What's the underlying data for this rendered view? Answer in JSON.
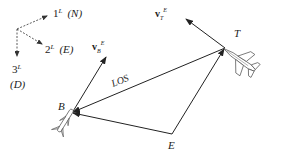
{
  "diagram": {
    "type": "engagement-geometry",
    "colors": {
      "stroke": "#222222",
      "aircraft": "#555555",
      "background": "#ffffff"
    },
    "frame": {
      "axis1": {
        "label": "1",
        "sup": "L",
        "dir": "(N)"
      },
      "axis2": {
        "label": "2",
        "sup": "L",
        "dir": "(E)"
      },
      "axis3": {
        "label": "3",
        "sup": "L",
        "dir": "(D)"
      }
    },
    "points": {
      "B": "B",
      "T": "T",
      "E": "E"
    },
    "los_label": "LOS",
    "vectors": {
      "vB": {
        "base": "v",
        "sub": "B",
        "sup": "E"
      },
      "vT": {
        "base": "v",
        "sub": "T",
        "sup": "E"
      }
    }
  }
}
